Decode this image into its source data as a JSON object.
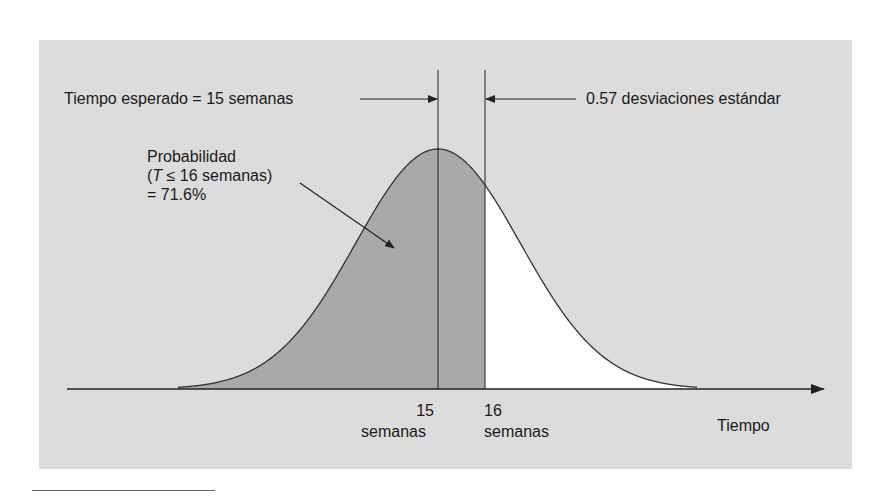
{
  "figure": {
    "expected_time_label": "Tiempo esperado = 15 semanas",
    "std_dev_label": "0.57 desviaciones estándar",
    "probability_label": {
      "line1": "Probabilidad",
      "line2_italic": "T",
      "line2_rest": " ≤ 16 semanas)",
      "line2_open": "(",
      "line3": "= 71.6%"
    },
    "tick_15": {
      "value": "15",
      "unit": "semanas"
    },
    "tick_16": {
      "value": "16",
      "unit": "semanas"
    },
    "x_axis_label": "Tiempo"
  },
  "colors": {
    "panel_bg": "#dcdcdc",
    "shaded_area": "#a9a9a9",
    "unshaded_area": "#ffffff",
    "lines": "#222222"
  },
  "chart_data": {
    "type": "area",
    "title": "",
    "distribution": "normal",
    "mean": 15,
    "z_score": 0.57,
    "cutoff": 16,
    "shaded_region": "T ≤ 16",
    "probability": 0.716,
    "xlabel": "Tiempo",
    "ylabel": "",
    "tick_labels": [
      "15 semanas",
      "16 semanas"
    ],
    "annotations": [
      "Tiempo esperado = 15 semanas",
      "0.57 desviaciones estándar",
      "Probabilidad (T ≤ 16 semanas) = 71.6%"
    ]
  }
}
